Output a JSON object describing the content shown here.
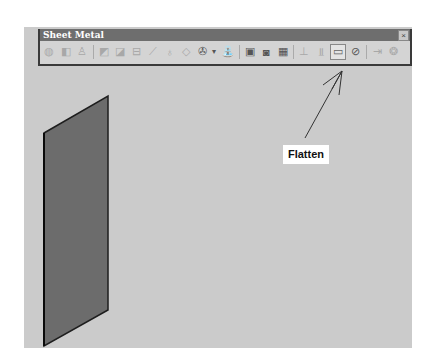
{
  "toolbar": {
    "title": "Sheet Metal",
    "close_glyph": "×",
    "icons": [
      {
        "name": "sheet-metal-parameters-icon",
        "glyph": "◍"
      },
      {
        "name": "walls-icon",
        "glyph": "◧"
      },
      {
        "name": "rolled-walls-icon",
        "glyph": "♙"
      },
      {
        "name": "wall-on-edge-icon",
        "glyph": "◩"
      },
      {
        "name": "extrusion-icon",
        "glyph": "◪"
      },
      {
        "name": "bend-icon",
        "glyph": "⊟"
      },
      {
        "name": "flange-icon",
        "glyph": "⟋"
      },
      {
        "name": "hem-icon",
        "glyph": "♁"
      },
      {
        "name": "tear-drop-icon",
        "glyph": "◇"
      },
      {
        "name": "cutting-icon",
        "glyph": "✇"
      },
      {
        "name": "stamping-icon",
        "glyph": "⛲"
      },
      {
        "name": "pattern-icon",
        "glyph": "▣"
      },
      {
        "name": "copy-icon",
        "glyph": "◙"
      },
      {
        "name": "grid-icon",
        "glyph": "▦"
      },
      {
        "name": "unfold-icon",
        "glyph": "⊥"
      },
      {
        "name": "fold-icon",
        "glyph": "⫫"
      },
      {
        "name": "flatten-icon",
        "glyph": "▭"
      },
      {
        "name": "fold-unfold-icon",
        "glyph": "⊘"
      },
      {
        "name": "point-mapping-icon",
        "glyph": "⇥"
      },
      {
        "name": "recognize-icon",
        "glyph": "❂"
      }
    ]
  },
  "annotation": {
    "label": "Flatten"
  }
}
